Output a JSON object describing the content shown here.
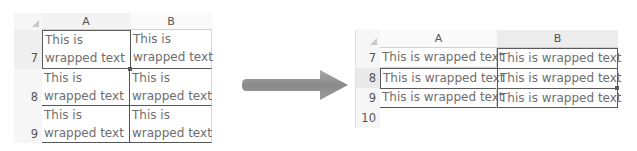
{
  "before": {
    "columns": [
      "A",
      "B"
    ],
    "rows": [
      {
        "num": "7",
        "cells": [
          [
            "This is",
            "wrapped text"
          ],
          [
            "This is",
            "wrapped text"
          ]
        ]
      },
      {
        "num": "8",
        "cells": [
          [
            "This is",
            "wrapped text"
          ],
          [
            "This is",
            "wrapped text"
          ]
        ]
      },
      {
        "num": "9",
        "cells": [
          [
            "This is",
            "wrapped text"
          ],
          [
            "This is",
            "wrapped text"
          ]
        ]
      }
    ],
    "selected_cell": "A7"
  },
  "arrow": {
    "icon": "right-arrow-icon",
    "color": "#8c8c8c"
  },
  "after": {
    "columns": [
      "A",
      "B"
    ],
    "rows": [
      {
        "num": "7",
        "cells": [
          "This is wrapped text",
          "This is wrapped text"
        ]
      },
      {
        "num": "8",
        "cells": [
          "This is wrapped text",
          "This is wrapped text"
        ]
      },
      {
        "num": "9",
        "cells": [
          "This is wrapped text",
          "This is wrapped text"
        ]
      },
      {
        "num": "10",
        "cells": [
          "",
          ""
        ]
      }
    ],
    "selected_range": "A8:B8, B7:B9"
  }
}
